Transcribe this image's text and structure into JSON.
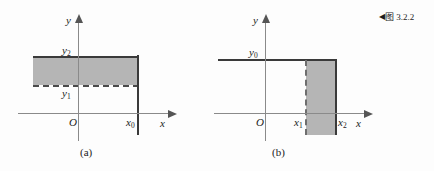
{
  "figure": {
    "caption_marker": "◀",
    "caption_text": "图 3.2.2"
  },
  "panel_a": {
    "sublabel": "(a)",
    "axis_x_label": "x",
    "axis_y_label": "y",
    "origin_label": "O",
    "labels": {
      "y_upper": "y",
      "y_upper_sub": "2",
      "y_lower": "y",
      "y_lower_sub": "1",
      "x_bound": "x",
      "x_bound_sub": "0"
    }
  },
  "panel_b": {
    "sublabel": "(b)",
    "axis_x_label": "x",
    "axis_y_label": "y",
    "origin_label": "O",
    "labels": {
      "y_bound": "y",
      "y_bound_sub": "0",
      "x_left": "x",
      "x_left_sub": "1",
      "x_right": "x",
      "x_right_sub": "2"
    }
  },
  "colors": {
    "shade": "#b5b5b5",
    "axis": "#8a8a8a",
    "boundary": "#3a3a3a",
    "text": "#1c1c1c",
    "background": "#fdfdfd"
  }
}
